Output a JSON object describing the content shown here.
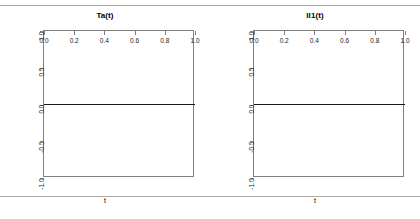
{
  "figure": {
    "background_color": "#ffffff",
    "rule_color": "#a9a9a9",
    "axis_color": "#808080",
    "line_color": "#1a1a1a"
  },
  "panels": [
    {
      "id": "panel-ta",
      "title": "Ta(t)",
      "xlabel": "t",
      "ylabel": "Ta(t)"
    },
    {
      "id": "panel-il1",
      "title": "Il1(t)",
      "xlabel": "t",
      "ylabel": "IL1(t)"
    }
  ],
  "chart_data": [
    {
      "type": "line",
      "title": "Ta(t)",
      "xlabel": "t",
      "ylabel": "Ta(t)",
      "x": [
        0.0,
        0.2,
        0.4,
        0.6,
        0.8,
        1.0
      ],
      "values": [
        0.0,
        0.0,
        0.0,
        0.0,
        0.0,
        0.0
      ],
      "xlim": [
        0.0,
        1.0
      ],
      "ylim": [
        -1.0,
        1.0
      ],
      "xticks": [
        "0.0",
        "0.2",
        "0.4",
        "0.6",
        "0.8",
        "1.0"
      ],
      "xtick_values": [
        0.0,
        0.2,
        0.4,
        0.6,
        0.8,
        1.0
      ],
      "yticks": [
        "1.0",
        "0.5",
        "0.0",
        "-0.5",
        "-1.0"
      ],
      "ytick_values": [
        1.0,
        0.5,
        0.0,
        -0.5,
        -1.0
      ],
      "grid": false,
      "legend": null,
      "line_color": "#1a1a1a"
    },
    {
      "type": "line",
      "title": "Il1(t)",
      "xlabel": "t",
      "ylabel": "IL1(t)",
      "x": [
        0.0,
        0.2,
        0.4,
        0.6,
        0.8,
        1.0
      ],
      "values": [
        0.0,
        0.0,
        0.0,
        0.0,
        0.0,
        0.0
      ],
      "xlim": [
        0.0,
        1.0
      ],
      "ylim": [
        -1.0,
        1.0
      ],
      "xticks": [
        "0.0",
        "0.2",
        "0.4",
        "0.6",
        "0.8",
        "1.0"
      ],
      "xtick_values": [
        0.0,
        0.2,
        0.4,
        0.6,
        0.8,
        1.0
      ],
      "yticks": [
        "1.0",
        "0.5",
        "0.0",
        "-0.5",
        "-1.0"
      ],
      "ytick_values": [
        1.0,
        0.5,
        0.0,
        -0.5,
        -1.0
      ],
      "grid": false,
      "legend": null,
      "line_color": "#1a1a1a"
    }
  ]
}
